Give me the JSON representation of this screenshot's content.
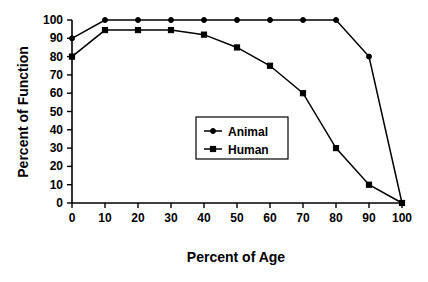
{
  "chart_data": {
    "type": "line",
    "title": "",
    "subtitle": "",
    "xlabel": "Percent of Age",
    "ylabel": "Percent of Function",
    "x": [
      0,
      10,
      20,
      30,
      40,
      50,
      60,
      70,
      80,
      90,
      100
    ],
    "xlim": [
      0,
      100
    ],
    "ylim": [
      0,
      100
    ],
    "xticks": [
      "0",
      "10",
      "20",
      "30",
      "40",
      "50",
      "60",
      "70",
      "80",
      "90",
      "100"
    ],
    "yticks": [
      "0",
      "10",
      "20",
      "30",
      "40",
      "50",
      "60",
      "70",
      "80",
      "90",
      "100"
    ],
    "grid": false,
    "legend_position": "center",
    "series": [
      {
        "name": "Animal",
        "marker": "circle",
        "color": "#000000",
        "values": [
          90,
          100,
          100,
          100,
          100,
          100,
          100,
          100,
          100,
          80,
          0
        ]
      },
      {
        "name": "Human",
        "marker": "square",
        "color": "#000000",
        "values": [
          80,
          94.5,
          94.5,
          94.5,
          92,
          85,
          75,
          60,
          30,
          10,
          0
        ]
      }
    ]
  },
  "legend": {
    "entries": [
      {
        "label": "Animal",
        "marker": "circle"
      },
      {
        "label": "Human",
        "marker": "square"
      }
    ]
  },
  "axes": {
    "x_title": "Percent of Age",
    "y_title": "Percent of Function"
  },
  "colors": {
    "background": "#ffffff",
    "foreground": "#000000"
  }
}
